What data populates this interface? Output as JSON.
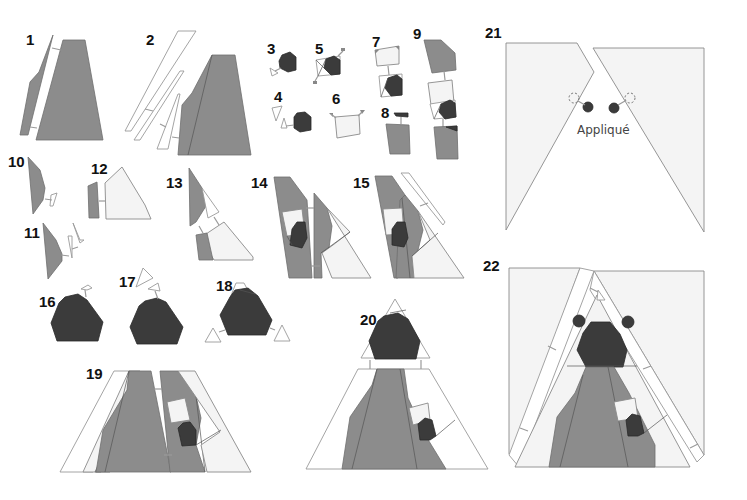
{
  "diagram": {
    "colors": {
      "medium_gray": "#8c8c8c",
      "dark_gray": "#3b3b3b",
      "light_fabric": "#f4f4f4",
      "background": "#ffffff",
      "outline": "#8a8a8a"
    },
    "steps": [
      {
        "number": "1",
        "label": "1"
      },
      {
        "number": "2",
        "label": "2"
      },
      {
        "number": "3",
        "label": "3"
      },
      {
        "number": "4",
        "label": "4"
      },
      {
        "number": "5",
        "label": "5"
      },
      {
        "number": "6",
        "label": "6"
      },
      {
        "number": "7",
        "label": "7"
      },
      {
        "number": "8",
        "label": "8"
      },
      {
        "number": "9",
        "label": "9"
      },
      {
        "number": "10",
        "label": "10"
      },
      {
        "number": "11",
        "label": "11"
      },
      {
        "number": "12",
        "label": "12"
      },
      {
        "number": "13",
        "label": "13"
      },
      {
        "number": "14",
        "label": "14"
      },
      {
        "number": "15",
        "label": "15"
      },
      {
        "number": "16",
        "label": "16"
      },
      {
        "number": "17",
        "label": "17"
      },
      {
        "number": "18",
        "label": "18"
      },
      {
        "number": "19",
        "label": "19"
      },
      {
        "number": "20",
        "label": "20"
      },
      {
        "number": "21",
        "label": "21"
      },
      {
        "number": "22",
        "label": "22"
      }
    ],
    "annotations": {
      "applique": "Appliqué"
    }
  }
}
